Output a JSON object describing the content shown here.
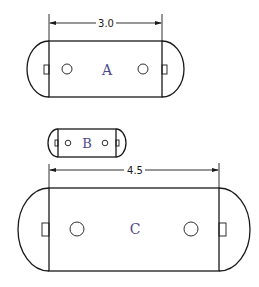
{
  "diagram": {
    "shapes": [
      {
        "id": "A",
        "label": "A",
        "dimension": "3.0"
      },
      {
        "id": "B",
        "label": "B"
      },
      {
        "id": "C",
        "label": "C",
        "dimension": "4.5"
      }
    ],
    "colors": {
      "line": "#1a1a1a",
      "label": "#4a4a8a",
      "background": "#ffffff"
    }
  }
}
